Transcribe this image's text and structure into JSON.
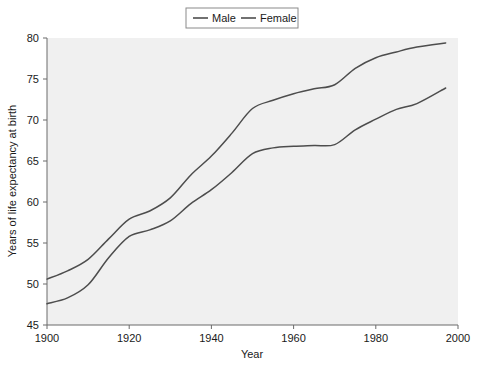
{
  "chart_data": {
    "type": "line",
    "title": "",
    "xlabel": "Year",
    "ylabel": "Years of life expectancy at birth",
    "xlim": [
      1900,
      2000
    ],
    "ylim": [
      45,
      80
    ],
    "xticks": [
      1900,
      1920,
      1940,
      1960,
      1980,
      2000
    ],
    "xtick_labels": [
      "1900",
      "1920",
      "1940",
      "1960",
      "1980",
      "2000"
    ],
    "yticks": [
      45,
      50,
      55,
      60,
      65,
      70,
      75,
      80
    ],
    "ytick_labels": [
      "45",
      "50",
      "55",
      "60",
      "65",
      "70",
      "75",
      "80"
    ],
    "grid": false,
    "legend_position": "top-center",
    "x": [
      1900,
      1905,
      1910,
      1915,
      1920,
      1925,
      1930,
      1935,
      1940,
      1945,
      1950,
      1955,
      1960,
      1965,
      1970,
      1975,
      1980,
      1985,
      1990,
      1997
    ],
    "series": [
      {
        "name": "Male",
        "color": "#4d4d4d",
        "values": [
          47.6,
          48.3,
          49.9,
          53.2,
          55.8,
          56.6,
          57.7,
          59.8,
          61.5,
          63.6,
          65.9,
          66.6,
          66.8,
          66.9,
          67.0,
          68.8,
          70.1,
          71.3,
          72.0,
          73.9
        ]
      },
      {
        "name": "Female",
        "color": "#4d4d4d",
        "values": [
          50.6,
          51.6,
          53.0,
          55.5,
          57.9,
          58.9,
          60.5,
          63.3,
          65.6,
          68.4,
          71.4,
          72.4,
          73.2,
          73.8,
          74.3,
          76.3,
          77.6,
          78.3,
          78.9,
          79.4
        ]
      }
    ]
  },
  "legend": {
    "entries": [
      {
        "label": "Male"
      },
      {
        "label": "Female"
      }
    ]
  },
  "colors": {
    "line": "#4d4d4d",
    "axis": "#6b6b6b",
    "text": "#1a1a1a",
    "plot_background": "#f0f0f0",
    "figure_background": "#ffffff",
    "legend_border": "#8a8a8a"
  }
}
